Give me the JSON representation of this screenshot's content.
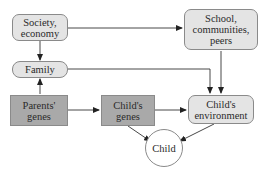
{
  "diagram": {
    "nodes": {
      "society": {
        "label": "Society, economy",
        "line1": "Society,",
        "line2": "economy",
        "style": "light-rounded"
      },
      "family": {
        "label": "Family",
        "style": "light-pill"
      },
      "school": {
        "label": "School, communities, peers",
        "line1": "School,",
        "line2": "communities,",
        "line3": "peers",
        "style": "light-rounded"
      },
      "parents_genes": {
        "label": "Parents' genes",
        "line1": "Parents'",
        "line2": "genes",
        "style": "dark-rect"
      },
      "childs_genes": {
        "label": "Child's genes",
        "line1": "Child's",
        "line2": "genes",
        "style": "dark-rect"
      },
      "childs_environment": {
        "label": "Child's environment",
        "line1": "Child's",
        "line2": "environment",
        "style": "light-rounded"
      },
      "child": {
        "label": "Child",
        "style": "circle"
      }
    },
    "edges": [
      {
        "from": "Society, economy",
        "to": "Family"
      },
      {
        "from": "Society, economy",
        "to": "School, communities, peers"
      },
      {
        "from": "Parents' genes",
        "to": "Family"
      },
      {
        "from": "Family",
        "to": "Child's environment"
      },
      {
        "from": "School, communities, peers",
        "to": "Child's environment"
      },
      {
        "from": "Parents' genes",
        "to": "Child's genes"
      },
      {
        "from": "Child's genes",
        "to": "Child's environment"
      },
      {
        "from": "Child's genes",
        "to": "Child"
      },
      {
        "from": "Child's environment",
        "to": "Child"
      }
    ],
    "colors": {
      "light_fill": "#e4e4e4",
      "dark_fill": "#a9a9a9",
      "stroke": "#8a8a8a",
      "arrow": "#222222"
    }
  }
}
